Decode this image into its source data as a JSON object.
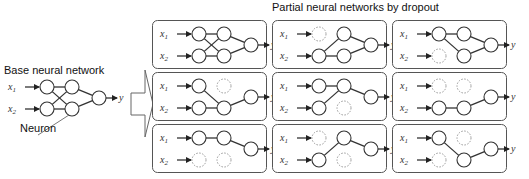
{
  "base": {
    "title": "Base neural network",
    "neuron_label": "Neuron",
    "inputs": [
      "x1",
      "x2"
    ],
    "output": "y"
  },
  "partial": {
    "title": "Partial neural networks by dropout"
  },
  "colors": {
    "stroke": "#333333",
    "dropped": "#999999",
    "box": "#555555",
    "arrow": "#666666"
  },
  "networks": [
    {
      "row": 0,
      "col": 0,
      "dropped": [],
      "edges": [
        [
          "i1",
          "h1"
        ],
        [
          "i1",
          "h2"
        ],
        [
          "i2",
          "h1"
        ],
        [
          "i2",
          "h2"
        ],
        [
          "h1",
          "o"
        ],
        [
          "h2",
          "o"
        ]
      ]
    },
    {
      "row": 0,
      "col": 1,
      "dropped": [
        "i1"
      ],
      "edges": [
        [
          "i2",
          "h1"
        ],
        [
          "i2",
          "h2"
        ],
        [
          "h1",
          "o"
        ],
        [
          "h2",
          "o"
        ]
      ]
    },
    {
      "row": 0,
      "col": 2,
      "dropped": [
        "i2"
      ],
      "edges": [
        [
          "i1",
          "h1"
        ],
        [
          "i1",
          "h2"
        ],
        [
          "h1",
          "o"
        ],
        [
          "h2",
          "o"
        ]
      ]
    },
    {
      "row": 1,
      "col": 0,
      "dropped": [
        "h1"
      ],
      "edges": [
        [
          "i1",
          "h2"
        ],
        [
          "i2",
          "h2"
        ],
        [
          "h2",
          "o"
        ]
      ]
    },
    {
      "row": 1,
      "col": 1,
      "dropped": [
        "h2"
      ],
      "edges": [
        [
          "i1",
          "h1"
        ],
        [
          "i2",
          "h1"
        ],
        [
          "h1",
          "o"
        ]
      ]
    },
    {
      "row": 1,
      "col": 2,
      "dropped": [
        "i1",
        "h1"
      ],
      "edges": [
        [
          "i2",
          "h2"
        ],
        [
          "h2",
          "o"
        ]
      ]
    },
    {
      "row": 2,
      "col": 0,
      "dropped": [
        "i2",
        "h2"
      ],
      "edges": [
        [
          "i1",
          "h1"
        ],
        [
          "h1",
          "o"
        ]
      ]
    },
    {
      "row": 2,
      "col": 1,
      "dropped": [
        "i1",
        "h2"
      ],
      "edges": [
        [
          "i2",
          "h1"
        ],
        [
          "h1",
          "o"
        ]
      ]
    },
    {
      "row": 2,
      "col": 2,
      "dropped": [
        "i2",
        "h1"
      ],
      "edges": [
        [
          "i1",
          "h2"
        ],
        [
          "h2",
          "o"
        ]
      ]
    }
  ]
}
